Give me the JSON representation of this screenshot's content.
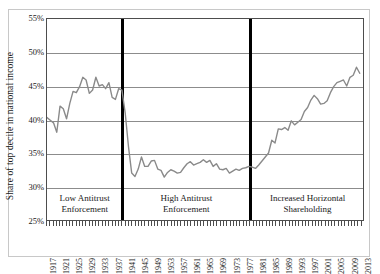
{
  "chart_data": {
    "type": "line",
    "title": "",
    "xlabel": "",
    "ylabel": "Share of top decile in national income",
    "ylim": [
      25,
      55
    ],
    "ytick_labels": [
      "55%",
      "50%",
      "45%",
      "40%",
      "35%",
      "30%",
      "25%"
    ],
    "ytick_values": [
      55,
      50,
      45,
      40,
      35,
      30,
      25
    ],
    "xlim": [
      1917,
      2014
    ],
    "xtick_labels": [
      "1917",
      "1921",
      "1925",
      "1929",
      "1933",
      "1937",
      "1941",
      "1945",
      "1949",
      "1953",
      "1957",
      "1961",
      "1965",
      "1969",
      "1973",
      "1977",
      "1981",
      "1985",
      "1989",
      "1993",
      "1997",
      "2001",
      "2005",
      "2009",
      "2013"
    ],
    "grid": "horizontal",
    "legend": "none",
    "line_color": "#8a8a8a",
    "divider_color": "#000000",
    "annotations": [
      {
        "label": "Low Antitrust\nEnforcement",
        "line1": "Low Antitrust",
        "line2": "Enforcement",
        "start_year": 1917,
        "end_year": 1940
      },
      {
        "label": "High Antitrust\nEnforcement",
        "line1": "High Antitrust",
        "line2": "Enforcement",
        "start_year": 1940,
        "end_year": 1979
      },
      {
        "label": "Increased Horizontal\nShareholding",
        "line1": "Increased Horizontal",
        "line2": "Shareholding",
        "start_year": 1979,
        "end_year": 2014
      }
    ],
    "divider_years": [
      1940,
      1979
    ],
    "x": [
      1917,
      1918,
      1919,
      1920,
      1921,
      1922,
      1923,
      1924,
      1925,
      1926,
      1927,
      1928,
      1929,
      1930,
      1931,
      1932,
      1933,
      1934,
      1935,
      1936,
      1937,
      1938,
      1939,
      1940,
      1941,
      1942,
      1943,
      1944,
      1945,
      1946,
      1947,
      1948,
      1949,
      1950,
      1951,
      1952,
      1953,
      1954,
      1955,
      1956,
      1957,
      1958,
      1959,
      1960,
      1961,
      1962,
      1963,
      1964,
      1965,
      1966,
      1967,
      1968,
      1969,
      1970,
      1971,
      1972,
      1973,
      1974,
      1975,
      1976,
      1977,
      1978,
      1979,
      1980,
      1981,
      1982,
      1983,
      1984,
      1985,
      1986,
      1987,
      1988,
      1989,
      1990,
      1991,
      1992,
      1993,
      1994,
      1995,
      1996,
      1997,
      1998,
      1999,
      2000,
      2001,
      2002,
      2003,
      2004,
      2005,
      2006,
      2007,
      2008,
      2009,
      2010,
      2011,
      2012,
      2013
    ],
    "values": [
      40.3,
      39.9,
      39.5,
      38.1,
      42.0,
      41.6,
      40.1,
      42.4,
      44.2,
      44.0,
      44.9,
      46.3,
      45.9,
      43.9,
      44.4,
      46.3,
      45.0,
      45.2,
      44.6,
      45.5,
      43.3,
      43.0,
      44.6,
      44.4,
      41.0,
      36.0,
      32.0,
      31.5,
      32.6,
      34.4,
      33.0,
      33.0,
      33.8,
      33.9,
      32.6,
      32.4,
      31.4,
      32.1,
      32.5,
      32.3,
      32.0,
      32.1,
      32.8,
      33.4,
      33.7,
      33.2,
      33.4,
      33.6,
      34.0,
      33.6,
      33.9,
      33.0,
      33.4,
      32.6,
      32.5,
      32.7,
      32.0,
      32.3,
      32.6,
      32.4,
      32.7,
      32.8,
      33.0,
      32.9,
      32.7,
      33.2,
      33.8,
      34.4,
      35.0,
      36.9,
      36.5,
      38.6,
      38.5,
      38.8,
      38.4,
      39.8,
      39.2,
      39.6,
      40.0,
      41.2,
      41.8,
      42.9,
      43.6,
      43.1,
      42.3,
      42.4,
      42.8,
      44.0,
      44.9,
      45.5,
      45.7,
      45.9,
      45.0,
      46.3,
      46.6,
      47.8,
      46.9
    ],
    "data_note": "Annual share of top income decile, 1917-2013"
  }
}
